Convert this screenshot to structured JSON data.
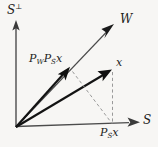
{
  "figure": {
    "kind": "vector-projection-diagram",
    "background_color": "#f7f6f4",
    "width": 158,
    "height": 147,
    "origin": {
      "x": 16,
      "y": 127
    }
  },
  "axes": {
    "vertical": {
      "name": "S-perp-axis",
      "label": "S",
      "superscript": "⊥",
      "from": {
        "x": 16,
        "y": 127
      },
      "to": {
        "x": 16,
        "y": 22
      }
    },
    "horizontal": {
      "name": "S-axis",
      "label": "S",
      "from": {
        "x": 16,
        "y": 127
      },
      "to": {
        "x": 139,
        "y": 122
      }
    }
  },
  "vectors": [
    {
      "id": "w-subspace-ray",
      "label": "W",
      "style": "thin",
      "from": {
        "x": 16,
        "y": 127
      },
      "to": {
        "x": 114,
        "y": 24
      }
    },
    {
      "id": "x-vector",
      "label": "x",
      "style": "thick",
      "from": {
        "x": 16,
        "y": 127
      },
      "to": {
        "x": 111,
        "y": 70
      }
    },
    {
      "id": "pw-ps-x-vector",
      "label": "P_W P_S x",
      "label_main": "P",
      "style": "thick",
      "from": {
        "x": 16,
        "y": 127
      },
      "to": {
        "x": 69,
        "y": 68
      }
    }
  ],
  "dashed_lines": [
    {
      "id": "x-to-psx-drop",
      "from": {
        "x": 112,
        "y": 71
      },
      "to": {
        "x": 112,
        "y": 124
      }
    },
    {
      "id": "pwpsx-to-psx-projection",
      "from": {
        "x": 72,
        "y": 71
      },
      "to": {
        "x": 112,
        "y": 124
      }
    }
  ],
  "labels": {
    "s_perp": {
      "base": "S",
      "sup": "⊥"
    },
    "w": "W",
    "s": "S",
    "x": "x",
    "pw_ps_x": {
      "p1": "P",
      "sub1": "W",
      "p2": "P",
      "sub2": "S",
      "arg": "x"
    },
    "ps_x": {
      "p": "P",
      "sub": "S",
      "arg": "x"
    }
  },
  "colors": {
    "axis": "#4c4c4c",
    "vector": "#131313",
    "thin_vector": "#4a4a4a",
    "dashed": "#9a9a9a",
    "text": "#1c1c1c"
  }
}
